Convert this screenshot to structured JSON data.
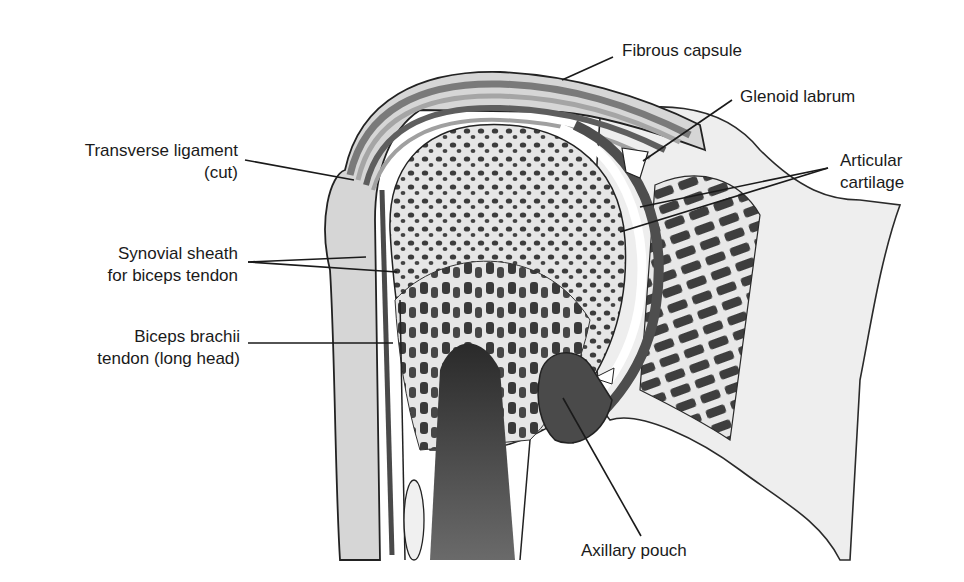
{
  "diagram": {
    "labels": {
      "fibrous_capsule": {
        "text": "Fibrous capsule"
      },
      "glenoid_labrum": {
        "text": "Glenoid labrum"
      },
      "articular_cartilage": {
        "line1": "Articular",
        "line2": "cartilage"
      },
      "transverse_ligament": {
        "line1": "Transverse ligament",
        "line2": "(cut)"
      },
      "synovial_sheath": {
        "line1": "Synovial sheath",
        "line2": "for biceps tendon"
      },
      "biceps_tendon": {
        "line1": "Biceps brachii",
        "line2": "tendon (long head)"
      },
      "axillary_pouch": {
        "text": "Axillary pouch"
      }
    },
    "colors": {
      "ink": "#1a1a1a",
      "dark_fill": "#5a5a5a",
      "mid_fill": "#9a9a9a",
      "light_fill": "#e2e2e2",
      "background": "#ffffff"
    }
  }
}
